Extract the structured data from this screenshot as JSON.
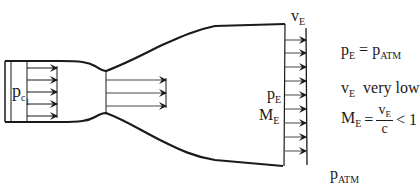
{
  "diagram": {
    "colors": {
      "stroke": "#1a1a1a",
      "background": "#ffffff"
    },
    "labels": {
      "chamber_pressure": {
        "base": "p",
        "sub": "c",
        "subsub": "1"
      },
      "exit_velocity_top": {
        "base": "v",
        "sub": "E"
      },
      "exit_pressure": {
        "base": "p",
        "sub": "E"
      },
      "exit_mach": {
        "base": "M",
        "sub": "E"
      },
      "ambient_pressure": {
        "base": "p",
        "sub": "ATM"
      }
    },
    "equations": {
      "pressure_match": {
        "lhs_base": "p",
        "lhs_sub": "E",
        "op": "=",
        "rhs_base": "p",
        "rhs_sub": "ATM"
      },
      "velocity_note": {
        "base": "v",
        "sub": "E",
        "text": "very low"
      },
      "mach": {
        "lhs_base": "M",
        "lhs_sub": "E",
        "op": "=",
        "num_base": "v",
        "num_sub": "E",
        "den": "c",
        "relation": "< 1"
      }
    },
    "arrows": {
      "chamber_count": 5,
      "throat_count": 3,
      "exit_count": 9
    }
  }
}
